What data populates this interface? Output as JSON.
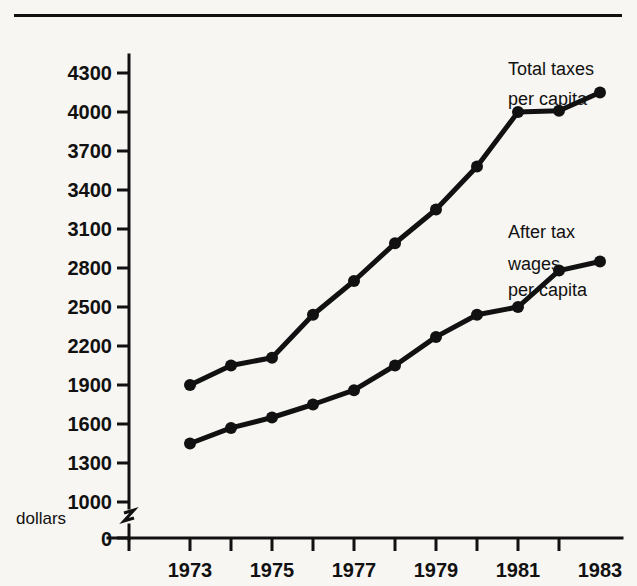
{
  "figure": {
    "name": "two-line-time-series-chart",
    "background_color": "#f8f6f2",
    "ink_color": "#111111"
  },
  "chart_data": {
    "type": "line",
    "title": "",
    "subtitle": "",
    "xlabel": "",
    "ylabel": "dollars",
    "x": [
      1973,
      1974,
      1975,
      1976,
      1977,
      1978,
      1979,
      1980,
      1981,
      1982,
      1983
    ],
    "categories": [
      "1973",
      "1974",
      "1975",
      "1976",
      "1977",
      "1978",
      "1979",
      "1980",
      "1981",
      "1982",
      "1983"
    ],
    "series": [
      {
        "name": "Total taxes per capita",
        "label_lines": [
          "Total taxes",
          "per capita"
        ],
        "values": [
          1900,
          2050,
          2110,
          2440,
          2700,
          2990,
          3250,
          3580,
          4000,
          4010,
          4150
        ],
        "marker": "filled-circle",
        "color": "#111111"
      },
      {
        "name": "After tax wages per capita",
        "label_lines": [
          "After tax",
          "wages",
          "per capita"
        ],
        "values": [
          1450,
          1570,
          1650,
          1750,
          1860,
          2050,
          2270,
          2440,
          2500,
          2780,
          2850
        ],
        "marker": "filled-circle",
        "color": "#111111"
      }
    ],
    "xlim": [
      1973,
      1984
    ],
    "ylim": [
      1000,
      4450
    ],
    "xticks": [
      1973,
      1974,
      1975,
      1976,
      1977,
      1978,
      1979,
      1980,
      1981,
      1982,
      1983,
      1984
    ],
    "xtick_labels": [
      "1973",
      "",
      "1975",
      "",
      "1977",
      "",
      "1979",
      "",
      "1981",
      "",
      "1983",
      ""
    ],
    "yticks": [
      1000,
      1300,
      1600,
      1900,
      2200,
      2500,
      2800,
      3100,
      3400,
      3700,
      4000,
      4300
    ],
    "ytick_labels": [
      "1000",
      "1300",
      "1600",
      "1900",
      "2200",
      "2500",
      "2800",
      "3100",
      "3400",
      "3700",
      "4000",
      "4300"
    ],
    "y_axis_break": true,
    "y_origin_label": "0",
    "grid": false,
    "legend_position": "inline-right-annotations"
  },
  "annotations": {
    "y_axis_caption": "dollars",
    "origin_label": "0",
    "series_one_line_one": "Total taxes",
    "series_one_line_two": "per capita",
    "series_two_line_one": "After tax",
    "series_two_line_two": "wages",
    "series_two_line_three": "per capita"
  },
  "ytick_values": {
    "t0": "4300",
    "t1": "4000",
    "t2": "3700",
    "t3": "3400",
    "t4": "3100",
    "t5": "2800",
    "t6": "2500",
    "t7": "2200",
    "t8": "1900",
    "t9": "1600",
    "t10": "1300",
    "t11": "1000"
  },
  "xtick_values": {
    "x0": "1973",
    "x1": "1975",
    "x2": "1977",
    "x3": "1979",
    "x4": "1981",
    "x5": "1983"
  }
}
